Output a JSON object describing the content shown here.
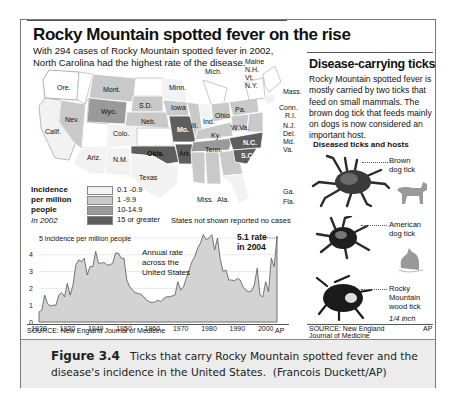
{
  "left_panel": {
    "title": "Rocky Mountain spotted fever on the rise",
    "subtitle": "With 294 cases of Rocky Mountain spotted fever in 2002, North Carolina had the highest rate of the disease.",
    "map": {
      "state_labels": [
        "Ore.",
        "Calif.",
        "Nev.",
        "Mont.",
        "Wyo.",
        "Colo.",
        "Ariz.",
        "N.M.",
        "S.D.",
        "Neb.",
        "Minn.",
        "Iowa",
        "Mo.",
        "Okla.",
        "Ark.",
        "Texas",
        "Mich.",
        "Ill.",
        "Ind.",
        "Ohio",
        "Ky.",
        "Tenn.",
        "W.Va.",
        "Pa.",
        "N.C.",
        "S.C.",
        "Miss.",
        "Ala.",
        "Ga.",
        "Fla.",
        "Maine",
        "N.H.",
        "Vt.",
        "N.Y.",
        "Mass.",
        "Conn.",
        "R.I.",
        "N.J.",
        "Del.",
        "Md.",
        "Va."
      ],
      "note": "States not shown reported no cases"
    },
    "legend": {
      "title_line1": "Incidence",
      "title_line2": "per million",
      "title_line3": "people",
      "year": "In 2002",
      "items": [
        {
          "label": "0.1 -0.9",
          "color": "#f2f2f2"
        },
        {
          "label": "1 -9.9",
          "color": "#c9c9c9"
        },
        {
          "label": "10-14.9",
          "color": "#9a9a9a"
        },
        {
          "label": "15 or greater",
          "color": "#5e5e5e"
        }
      ]
    },
    "chart": {
      "y_title": "5 incidence per million people",
      "annotation": "Annual rate across the United States",
      "callout_line1": "5.1 rate",
      "callout_line2": "in 2004"
    },
    "source": "SOURCE: New England Journal of Medicine",
    "credit": "AP"
  },
  "chart_data": {
    "type": "area",
    "title": "Rocky Mountain spotted fever on the rise",
    "ylabel": "incidence per million people",
    "xlabel": "",
    "ylim": [
      0,
      5
    ],
    "xlim": [
      1920,
      2004
    ],
    "yticks": [
      0,
      1,
      2,
      3,
      4,
      5
    ],
    "xticks": [
      1920,
      1930,
      1940,
      1950,
      1960,
      1970,
      1980,
      1990,
      2000
    ],
    "grid": true,
    "annotations": [
      "Annual rate across the United States",
      "5.1 rate in 2004"
    ],
    "x": [
      1920,
      1921,
      1922,
      1923,
      1924,
      1925,
      1926,
      1927,
      1928,
      1929,
      1930,
      1931,
      1932,
      1933,
      1934,
      1935,
      1936,
      1937,
      1938,
      1939,
      1940,
      1941,
      1942,
      1943,
      1944,
      1945,
      1946,
      1947,
      1948,
      1949,
      1950,
      1951,
      1952,
      1953,
      1954,
      1955,
      1956,
      1957,
      1958,
      1959,
      1960,
      1961,
      1962,
      1963,
      1964,
      1965,
      1966,
      1967,
      1968,
      1969,
      1970,
      1971,
      1972,
      1973,
      1974,
      1975,
      1976,
      1977,
      1978,
      1979,
      1980,
      1981,
      1982,
      1983,
      1984,
      1985,
      1986,
      1987,
      1988,
      1989,
      1990,
      1991,
      1992,
      1993,
      1994,
      1995,
      1996,
      1997,
      1998,
      1999,
      2000,
      2001,
      2002,
      2003,
      2004
    ],
    "values": [
      0.6,
      0.7,
      1.6,
      1.1,
      0.95,
      1.0,
      1.0,
      1.6,
      1.75,
      1.5,
      2.3,
      1.6,
      2.2,
      3.4,
      3.7,
      3.6,
      3.8,
      2.8,
      3.3,
      3.3,
      4.2,
      3.5,
      3.5,
      3.55,
      3.4,
      3.4,
      3.5,
      4.1,
      4.1,
      3.8,
      3.8,
      2.5,
      2.1,
      1.9,
      1.75,
      1.7,
      1.65,
      1.5,
      1.3,
      1.2,
      1.15,
      1.2,
      1.3,
      1.2,
      1.4,
      1.5,
      1.5,
      1.55,
      1.6,
      2.4,
      1.9,
      2.1,
      2.6,
      3.1,
      3.6,
      3.9,
      4.4,
      4.7,
      5.2,
      4.9,
      5.0,
      5.2,
      4.3,
      5.0,
      3.7,
      3.0,
      3.1,
      2.5,
      2.5,
      2.45,
      2.6,
      2.5,
      2.1,
      1.9,
      1.8,
      1.85,
      2.2,
      3.2,
      1.6,
      1.5,
      2.4,
      1.8,
      3.8,
      3.3,
      5.1
    ]
  },
  "right_panel": {
    "title": "Disease-carrying ticks",
    "body": "Rocky Mountain spotted fever is mostly carried by two ticks that feed on small mammals. The brown dog tick that feeds mainly on dogs is now considered an important host.",
    "subheading": "Diseased ticks and hosts",
    "ticks": [
      {
        "name_line1": "Brown",
        "name_line2": "dog tick",
        "host": "dog-icon"
      },
      {
        "name_line1": "American",
        "name_line2": "dog tick",
        "host": "mouse-icon"
      },
      {
        "name_line1": "Rocky",
        "name_line2": "Mountain",
        "name_line3": "wood tick"
      }
    ],
    "scale": "1/4 inch",
    "source_line1": "SOURCE: New England",
    "source_line2": "Journal of Medicine",
    "credit": "AP"
  },
  "caption": {
    "figure_label": "Figure 3.4",
    "text": "Ticks that carry Rocky Mountain spotted fever and the disease's incidence in the United States.",
    "credit": "(Francois Duckett/AP)"
  }
}
